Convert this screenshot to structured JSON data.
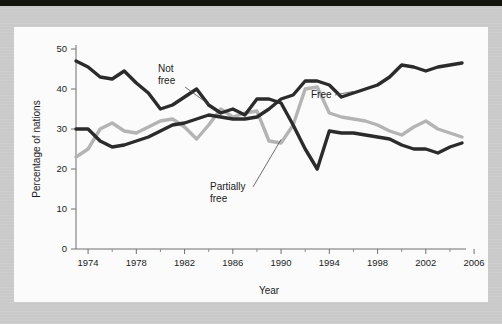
{
  "chart_data": {
    "type": "line",
    "title": "",
    "xlabel": "Year",
    "ylabel": "Percentage of nations",
    "xlim": [
      1973,
      2005
    ],
    "ylim": [
      0,
      50
    ],
    "ytick_labels": [
      "0",
      "10",
      "20",
      "30",
      "40",
      "50"
    ],
    "ytick_values": [
      0,
      10,
      20,
      30,
      40,
      50
    ],
    "xtick_labels": [
      "1974",
      "1978",
      "1982",
      "1986",
      "1990",
      "1994",
      "1998",
      "2002",
      "2006"
    ],
    "xtick_values": [
      1974,
      1978,
      1982,
      1986,
      1990,
      1994,
      1998,
      2002,
      2006
    ],
    "grid": false,
    "legend": "annotations-on-plot",
    "x": [
      1973,
      1974,
      1975,
      1976,
      1977,
      1978,
      1979,
      1980,
      1981,
      1982,
      1983,
      1984,
      1985,
      1986,
      1987,
      1988,
      1989,
      1990,
      1991,
      1992,
      1993,
      1994,
      1995,
      1996,
      1997,
      1998,
      1999,
      2000,
      2001,
      2002,
      2003,
      2004,
      2005
    ],
    "series": [
      {
        "name": "Free",
        "color": "#2b2b2b",
        "values": [
          30,
          30,
          27,
          25.5,
          26,
          27,
          28,
          29.5,
          31,
          31.5,
          32.5,
          33.5,
          33,
          32.5,
          32.5,
          33,
          35,
          37.5,
          38.5,
          42,
          42,
          41,
          38,
          39,
          40,
          41,
          43,
          46,
          45.5,
          44.5,
          45.5,
          46,
          46.5
        ]
      },
      {
        "name": "Not free",
        "color": "#2b2b2b",
        "values": [
          47,
          45.5,
          43,
          42.5,
          44.5,
          41.5,
          39,
          35,
          36,
          38,
          40,
          36,
          34,
          35,
          33.5,
          37.5,
          37.5,
          36.5,
          31,
          25,
          20,
          29.5,
          29,
          29,
          28.5,
          28,
          27.5,
          26,
          25,
          25,
          24,
          25.5,
          26.5
        ]
      },
      {
        "name": "Partially free",
        "color": "#b4b4b4",
        "values": [
          23,
          25,
          30,
          31.5,
          29.5,
          29,
          30.5,
          32,
          32.5,
          30.5,
          27.5,
          31,
          35,
          33,
          34,
          34.5,
          27,
          26.5,
          31,
          40,
          40.5,
          34,
          33,
          32.5,
          32,
          31,
          29.5,
          28.5,
          30.5,
          32,
          30,
          29,
          28
        ]
      }
    ],
    "annotations": [
      {
        "label_line1": "Not",
        "label_line2": "free"
      },
      {
        "label_line1": "Free",
        "label_line2": ""
      },
      {
        "label_line1": "Partially",
        "label_line2": "free"
      }
    ]
  }
}
